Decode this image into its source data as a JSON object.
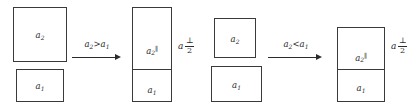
{
  "diagram": {
    "type": "transformation-sequence",
    "background_color": "#ffffff",
    "stroke_color": "#3a3a3a",
    "text_color": "#2b2b2b",
    "stages": [
      {
        "id": "stage-1-separated",
        "boxes": [
          {
            "label": "a",
            "subscript": "2",
            "superscript": ""
          },
          {
            "label": "a",
            "subscript": "1",
            "superscript": ""
          }
        ]
      },
      {
        "id": "stage-1-combined",
        "boxes": [
          {
            "label": "a",
            "subscript": "2",
            "superscript": "∥"
          },
          {
            "label": "a",
            "subscript": "1",
            "superscript": ""
          }
        ],
        "annotation": {
          "variable": "a",
          "numerator": "⊥",
          "denominator": "2"
        }
      },
      {
        "id": "stage-2-separated",
        "boxes": [
          {
            "label": "a",
            "subscript": "2",
            "superscript": ""
          },
          {
            "label": "a",
            "subscript": "1",
            "superscript": ""
          }
        ]
      },
      {
        "id": "stage-2-combined",
        "boxes": [
          {
            "label": "a",
            "subscript": "2",
            "superscript": "∥"
          },
          {
            "label": "a",
            "subscript": "1",
            "superscript": ""
          }
        ],
        "annotation": {
          "variable": "a",
          "numerator": "⊥",
          "denominator": "2"
        }
      }
    ],
    "arrows": [
      {
        "id": "arrow-1",
        "condition": "a2 > a1",
        "lhs": "a",
        "lhs_sub": "2",
        "operator": ">",
        "rhs": "a",
        "rhs_sub": "1"
      },
      {
        "id": "arrow-2",
        "condition": "a2 < a1",
        "lhs": "a",
        "lhs_sub": "2",
        "operator": "<",
        "rhs": "a",
        "rhs_sub": "1"
      }
    ]
  }
}
